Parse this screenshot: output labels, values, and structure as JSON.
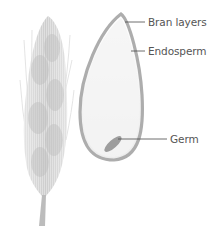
{
  "diagram": {
    "type": "labeled-illustration",
    "labels": [
      {
        "id": "bran",
        "text": "Bran layers"
      },
      {
        "id": "endosperm",
        "text": "Endosperm"
      },
      {
        "id": "germ",
        "text": "Germ"
      }
    ]
  },
  "colors": {
    "background": "#ffffff",
    "bran_outline": "#a9a9a9",
    "endosperm_fill": "#f3f3f3",
    "germ_fill": "#9c9c9c",
    "leader_line": "#4a4a4a",
    "label_text": "#555555",
    "wheat_ear": "#cfcfcf"
  }
}
